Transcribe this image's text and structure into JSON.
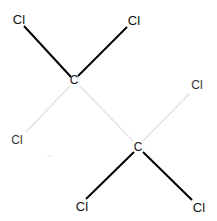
{
  "molecule": {
    "name": "hexachloroethane",
    "atoms": [
      {
        "id": "cl1",
        "label": "Cl",
        "x": 19,
        "y": 19
      },
      {
        "id": "cl2",
        "label": "Cl",
        "x": 134,
        "y": 20
      },
      {
        "id": "c1",
        "label": "C",
        "x": 74,
        "y": 80
      },
      {
        "id": "cl3",
        "label": "Cl",
        "x": 197,
        "y": 85
      },
      {
        "id": "cl4",
        "label": "Cl",
        "x": 17,
        "y": 140
      },
      {
        "id": "c2",
        "label": "C",
        "x": 138,
        "y": 147
      },
      {
        "id": "cl5",
        "label": "Cl",
        "x": 82,
        "y": 206
      },
      {
        "id": "cl6",
        "label": "Cl",
        "x": 199,
        "y": 207
      }
    ],
    "bonds": [
      {
        "from": "c1",
        "to": "cl1",
        "style": "solid"
      },
      {
        "from": "c1",
        "to": "cl2",
        "style": "solid"
      },
      {
        "from": "c1",
        "to": "cl4",
        "style": "faint"
      },
      {
        "from": "c1",
        "to": "c2",
        "style": "faint"
      },
      {
        "from": "c2",
        "to": "cl3",
        "style": "faint"
      },
      {
        "from": "c2",
        "to": "cl5",
        "style": "solid"
      },
      {
        "from": "c2",
        "to": "cl6",
        "style": "solid"
      }
    ],
    "colors": {
      "solid": "#000000",
      "faint": "#e4e4e4",
      "text": "#111111"
    }
  }
}
